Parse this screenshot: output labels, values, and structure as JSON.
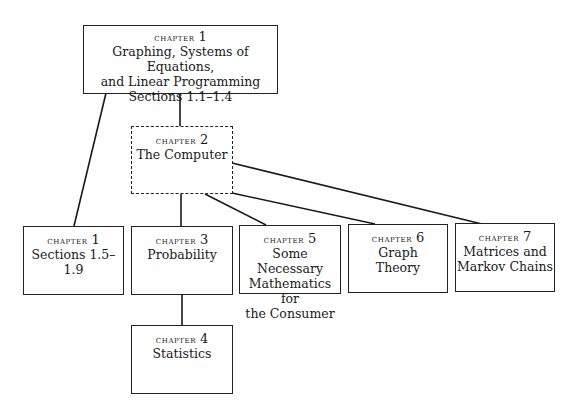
{
  "diagram": {
    "nodes": [
      {
        "id": "ch1a",
        "chapter_label": "chapter",
        "chapter_number": "1",
        "lines": [
          "Graphing, Systems of Equations,",
          "and Linear Programming",
          "Sections 1.1–1.4"
        ],
        "style": "solid"
      },
      {
        "id": "ch2",
        "chapter_label": "chapter",
        "chapter_number": "2",
        "lines": [
          "The Computer"
        ],
        "style": "dashed"
      },
      {
        "id": "ch1b",
        "chapter_label": "chapter",
        "chapter_number": "1",
        "lines": [
          "Sections 1.5–1.9"
        ],
        "style": "solid"
      },
      {
        "id": "ch3",
        "chapter_label": "chapter",
        "chapter_number": "3",
        "lines": [
          "Probability"
        ],
        "style": "solid"
      },
      {
        "id": "ch5",
        "chapter_label": "chapter",
        "chapter_number": "5",
        "lines": [
          "Some Necessary",
          "Mathematics for",
          "the Consumer"
        ],
        "style": "solid"
      },
      {
        "id": "ch6",
        "chapter_label": "chapter",
        "chapter_number": "6",
        "lines": [
          "Graph",
          "Theory"
        ],
        "style": "solid"
      },
      {
        "id": "ch7",
        "chapter_label": "chapter",
        "chapter_number": "7",
        "lines": [
          "Matrices and",
          "Markov Chains"
        ],
        "style": "solid"
      },
      {
        "id": "ch4",
        "chapter_label": "chapter",
        "chapter_number": "4",
        "lines": [
          "Statistics"
        ],
        "style": "solid"
      }
    ],
    "edges": [
      {
        "from": "ch1a",
        "to": "ch2"
      },
      {
        "from": "ch1a",
        "to": "ch1b"
      },
      {
        "from": "ch2",
        "to": "ch3"
      },
      {
        "from": "ch2",
        "to": "ch5"
      },
      {
        "from": "ch2",
        "to": "ch6"
      },
      {
        "from": "ch2",
        "to": "ch7"
      },
      {
        "from": "ch3",
        "to": "ch4"
      }
    ]
  }
}
